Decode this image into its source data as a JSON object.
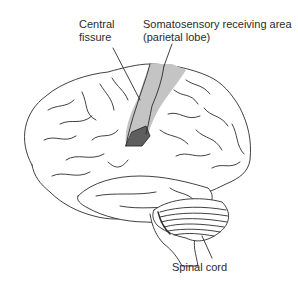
{
  "diagram": {
    "type": "anatomical-illustration",
    "labels": [
      {
        "id": "central-fissure",
        "text": "Central\nfissure"
      },
      {
        "id": "somatosensory",
        "text": "Somatosensory receiving area\n(parietal lobe)"
      },
      {
        "id": "spinal-cord",
        "text": "Spinal cord"
      }
    ],
    "colors": {
      "outline": "#2b2b2b",
      "somatosensory_fill": "#c4c4c4",
      "highlight_fill": "#5e5e5e",
      "brain_fill": "#ffffff"
    }
  }
}
